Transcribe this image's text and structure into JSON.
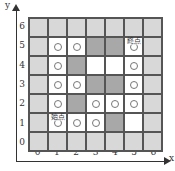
{
  "axes": {
    "x_label": "x",
    "y_label": "y",
    "x_ticks": [
      "0",
      "1",
      "2",
      "3",
      "4",
      "5",
      "6"
    ],
    "y_ticks": [
      "6",
      "5",
      "4",
      "3",
      "2",
      "1",
      "0"
    ]
  },
  "colors": {
    "light": "#d8d8d8",
    "dark": "#a8a8a8",
    "white": "#ffffff",
    "grid_line": "#555555"
  },
  "labels": {
    "start": "始点",
    "end": "終点"
  },
  "grid": {
    "rows_top_to_bottom": [
      {
        "y": 6,
        "cells": [
          {
            "x": 0,
            "type": "light",
            "circle": false
          },
          {
            "x": 1,
            "type": "light",
            "circle": false
          },
          {
            "x": 2,
            "type": "light",
            "circle": false
          },
          {
            "x": 3,
            "type": "light",
            "circle": false
          },
          {
            "x": 4,
            "type": "light",
            "circle": false
          },
          {
            "x": 5,
            "type": "light",
            "circle": false
          },
          {
            "x": 6,
            "type": "light",
            "circle": false
          }
        ]
      },
      {
        "y": 5,
        "cells": [
          {
            "x": 0,
            "type": "light",
            "circle": false
          },
          {
            "x": 1,
            "type": "white",
            "circle": true
          },
          {
            "x": 2,
            "type": "white",
            "circle": true
          },
          {
            "x": 3,
            "type": "dark",
            "circle": false
          },
          {
            "x": 4,
            "type": "dark",
            "circle": false
          },
          {
            "x": 5,
            "type": "white",
            "circle": true,
            "label": "end"
          },
          {
            "x": 6,
            "type": "light",
            "circle": false
          }
        ]
      },
      {
        "y": 4,
        "cells": [
          {
            "x": 0,
            "type": "light",
            "circle": false
          },
          {
            "x": 1,
            "type": "white",
            "circle": true
          },
          {
            "x": 2,
            "type": "dark",
            "circle": false
          },
          {
            "x": 3,
            "type": "white",
            "circle": false
          },
          {
            "x": 4,
            "type": "white",
            "circle": false
          },
          {
            "x": 5,
            "type": "white",
            "circle": true
          },
          {
            "x": 6,
            "type": "light",
            "circle": false
          }
        ]
      },
      {
        "y": 3,
        "cells": [
          {
            "x": 0,
            "type": "light",
            "circle": false
          },
          {
            "x": 1,
            "type": "white",
            "circle": true
          },
          {
            "x": 2,
            "type": "white",
            "circle": true
          },
          {
            "x": 3,
            "type": "dark",
            "circle": false
          },
          {
            "x": 4,
            "type": "dark",
            "circle": false
          },
          {
            "x": 5,
            "type": "white",
            "circle": true
          },
          {
            "x": 6,
            "type": "light",
            "circle": false
          }
        ]
      },
      {
        "y": 2,
        "cells": [
          {
            "x": 0,
            "type": "light",
            "circle": false
          },
          {
            "x": 1,
            "type": "white",
            "circle": true
          },
          {
            "x": 2,
            "type": "dark",
            "circle": false
          },
          {
            "x": 3,
            "type": "white",
            "circle": true
          },
          {
            "x": 4,
            "type": "white",
            "circle": true
          },
          {
            "x": 5,
            "type": "white",
            "circle": true
          },
          {
            "x": 6,
            "type": "light",
            "circle": false
          }
        ]
      },
      {
        "y": 1,
        "cells": [
          {
            "x": 0,
            "type": "light",
            "circle": false
          },
          {
            "x": 1,
            "type": "white",
            "circle": true,
            "label": "start"
          },
          {
            "x": 2,
            "type": "white",
            "circle": true
          },
          {
            "x": 3,
            "type": "white",
            "circle": true
          },
          {
            "x": 4,
            "type": "dark",
            "circle": false
          },
          {
            "x": 5,
            "type": "white",
            "circle": false
          },
          {
            "x": 6,
            "type": "light",
            "circle": false
          }
        ]
      },
      {
        "y": 0,
        "cells": [
          {
            "x": 0,
            "type": "light",
            "circle": false
          },
          {
            "x": 1,
            "type": "light",
            "circle": false
          },
          {
            "x": 2,
            "type": "light",
            "circle": false
          },
          {
            "x": 3,
            "type": "light",
            "circle": false
          },
          {
            "x": 4,
            "type": "light",
            "circle": false
          },
          {
            "x": 5,
            "type": "light",
            "circle": false
          },
          {
            "x": 6,
            "type": "light",
            "circle": false
          }
        ]
      }
    ]
  }
}
